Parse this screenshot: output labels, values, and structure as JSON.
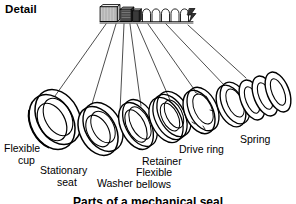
{
  "figure": {
    "title": "Detail",
    "caption": "Parts of a mechanical seal",
    "background_color": "#ffffff",
    "ink_color": "#000000",
    "width": 296,
    "height": 204,
    "style": "exploded-view line drawing"
  },
  "assembly": {
    "name": "assembled-mechanical-seal",
    "description": "small assembled seal stack shown at top centre"
  },
  "parts": [
    {
      "id": "flexible-cup",
      "label": "Flexible cup",
      "label_lines": [
        "Flexible",
        "cup"
      ],
      "order": 1
    },
    {
      "id": "stationary-seat",
      "label": "Stationary seat",
      "label_lines": [
        "Stationary",
        "seat"
      ],
      "order": 2
    },
    {
      "id": "washer",
      "label": "Washer",
      "label_lines": [
        "Washer"
      ],
      "order": 3
    },
    {
      "id": "flexible-bellows",
      "label": "Flexible bellows",
      "label_lines": [
        "Flexible",
        "bellows"
      ],
      "order": 4
    },
    {
      "id": "retainer",
      "label": "Retainer",
      "label_lines": [
        "Retainer"
      ],
      "order": 5
    },
    {
      "id": "drive-ring",
      "label": "Drive ring",
      "label_lines": [
        "Drive ring"
      ],
      "order": 6
    },
    {
      "id": "spring",
      "label": "Spring",
      "label_lines": [
        "Spring"
      ],
      "order": 7
    }
  ],
  "labels": {
    "flexible_cup_1": "Flexible",
    "flexible_cup_2": "cup",
    "stationary_seat_1": "Stationary",
    "stationary_seat_2": "seat",
    "washer_1": "Washer",
    "flexible_bellows_1": "Flexible",
    "flexible_bellows_2": "bellows",
    "retainer_1": "Retainer",
    "drive_ring_1": "Drive ring",
    "spring_1": "Spring"
  }
}
